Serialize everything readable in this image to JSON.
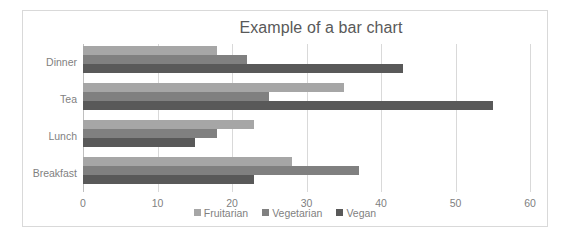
{
  "chart_data": {
    "type": "bar",
    "orientation": "horizontal",
    "title": "Example of a bar chart",
    "xlabel": "",
    "ylabel": "",
    "categories": [
      "Breakfast",
      "Lunch",
      "Tea",
      "Dinner"
    ],
    "categories_top_to_bottom": [
      "Dinner",
      "Tea",
      "Lunch",
      "Breakfast"
    ],
    "series": [
      {
        "name": "Fruitarian",
        "color": "#a6a6a6",
        "values": [
          28,
          23,
          35,
          18
        ]
      },
      {
        "name": "Vegetarian",
        "color": "#808080",
        "values": [
          37,
          18,
          25,
          22
        ]
      },
      {
        "name": "Vegan",
        "color": "#595959",
        "values": [
          23,
          15,
          55,
          43
        ]
      }
    ],
    "xlim": [
      0,
      60
    ],
    "xticks": [
      0,
      10,
      20,
      30,
      40,
      50,
      60
    ],
    "xtick_labels": [
      "0",
      "10",
      "20",
      "30",
      "40",
      "50",
      "60"
    ],
    "grid": "vertical",
    "legend_position": "bottom",
    "legend_entries": [
      "Fruitarian",
      "Vegetarian",
      "Vegan"
    ]
  },
  "style": {
    "title_color": "#595959",
    "label_color": "#7f7f7f",
    "grid_color": "#d9d9d9",
    "frame_color": "#d9d9d9",
    "background": "#ffffff"
  }
}
